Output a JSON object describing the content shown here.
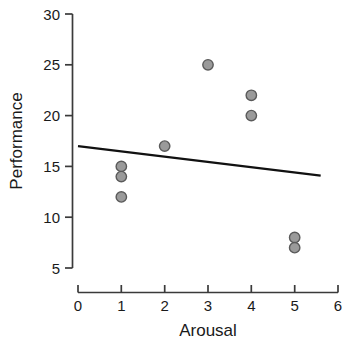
{
  "chart_data": {
    "type": "scatter",
    "title": "",
    "xlabel": "Arousal",
    "ylabel": "Performance",
    "xlim": [
      0,
      6
    ],
    "ylim": [
      5,
      30
    ],
    "xticks": [
      0,
      1,
      2,
      3,
      4,
      5,
      6
    ],
    "yticks": [
      5,
      10,
      15,
      20,
      25,
      30
    ],
    "xtick_labels": [
      "0",
      "1",
      "2",
      "3",
      "4",
      "5",
      "6"
    ],
    "ytick_labels": [
      "5",
      "10",
      "15",
      "20",
      "25",
      "30"
    ],
    "grid": false,
    "legend": null,
    "series": [
      {
        "name": "observations",
        "marker": "circle",
        "fill_color": "#9a9a9a",
        "edge_color": "#5a5a5a",
        "points": [
          {
            "x": 1,
            "y": 15
          },
          {
            "x": 1,
            "y": 14
          },
          {
            "x": 1,
            "y": 12
          },
          {
            "x": 2,
            "y": 17
          },
          {
            "x": 3,
            "y": 25
          },
          {
            "x": 4,
            "y": 22
          },
          {
            "x": 4,
            "y": 20
          },
          {
            "x": 5,
            "y": 8
          },
          {
            "x": 5,
            "y": 7
          }
        ]
      }
    ],
    "trendline": {
      "name": "regression-line",
      "color": "#111111",
      "x_start": 0,
      "y_start": 17,
      "x_end": 5.6,
      "y_end": 14.1
    }
  },
  "axes": {
    "y_axis_name": "y-axis",
    "x_axis_name": "x-axis"
  }
}
